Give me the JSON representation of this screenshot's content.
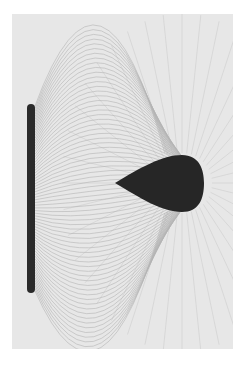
{
  "image": {
    "description": "Grass-seed-in-oil photograph of the electric field lines between a vertical charged bar and a teardrop-shaped conductor",
    "background_color": "#e6e6e6",
    "line_color": "#9a9a9a",
    "object_color": "#262626",
    "objects": [
      {
        "name": "charged-bar",
        "shape": "vertical rounded bar"
      },
      {
        "name": "teardrop-conductor",
        "shape": "teardrop pointing left"
      }
    ]
  }
}
